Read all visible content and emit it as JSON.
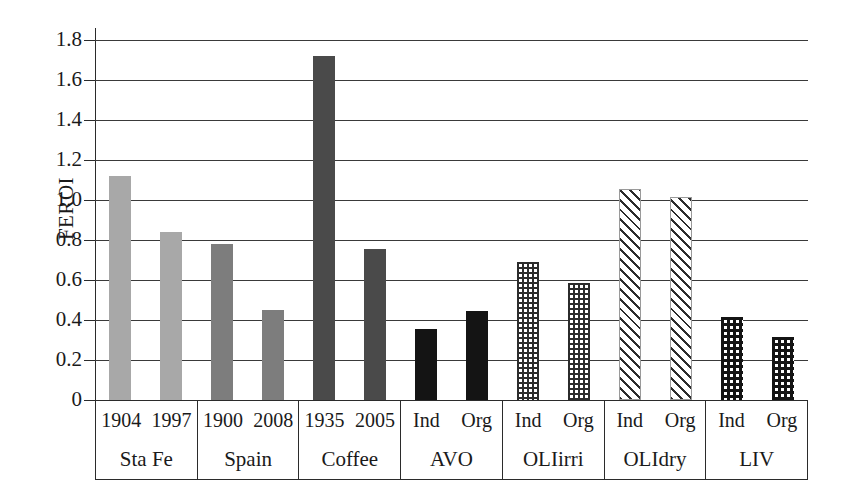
{
  "chart_data": {
    "type": "bar",
    "title": "",
    "xlabel": "",
    "ylabel": "FEROI",
    "ylim": [
      0,
      1.8
    ],
    "yticks": [
      "0",
      "0.2",
      "0.4",
      "0.6",
      "0.8",
      "1.0",
      "1.2",
      "1.4",
      "1.6",
      "1.8"
    ],
    "ytick_values": [
      0,
      0.2,
      0.4,
      0.6,
      0.8,
      1.0,
      1.2,
      1.4,
      1.6,
      1.8
    ],
    "grid": true,
    "legend": "none",
    "groups": [
      {
        "name": "Sta Fe",
        "bars": [
          {
            "label": "1904",
            "value": 1.12,
            "style": "fill-lightgray"
          },
          {
            "label": "1997",
            "value": 0.84,
            "style": "fill-lightgray"
          }
        ]
      },
      {
        "name": "Spain",
        "bars": [
          {
            "label": "1900",
            "value": 0.78,
            "style": "fill-midgray"
          },
          {
            "label": "2008",
            "value": 0.45,
            "style": "fill-midgray"
          }
        ]
      },
      {
        "name": "Coffee",
        "bars": [
          {
            "label": "1935",
            "value": 1.72,
            "style": "fill-darkgray"
          },
          {
            "label": "2005",
            "value": 0.755,
            "style": "fill-darkgray"
          }
        ]
      },
      {
        "name": "AVO",
        "bars": [
          {
            "label": "Ind",
            "value": 0.355,
            "style": "fill-black"
          },
          {
            "label": "Org",
            "value": 0.445,
            "style": "fill-black"
          }
        ]
      },
      {
        "name": "OLIirri",
        "bars": [
          {
            "label": "Ind",
            "value": 0.69,
            "style": "fill-grid"
          },
          {
            "label": "Org",
            "value": 0.585,
            "style": "fill-grid"
          }
        ]
      },
      {
        "name": "OLIdry",
        "bars": [
          {
            "label": "Ind",
            "value": 1.055,
            "style": "fill-diag"
          },
          {
            "label": "Org",
            "value": 1.015,
            "style": "fill-diag"
          }
        ]
      },
      {
        "name": "LIV",
        "bars": [
          {
            "label": "Ind",
            "value": 0.415,
            "style": "fill-dots"
          },
          {
            "label": "Org",
            "value": 0.315,
            "style": "fill-dots"
          }
        ]
      }
    ]
  }
}
